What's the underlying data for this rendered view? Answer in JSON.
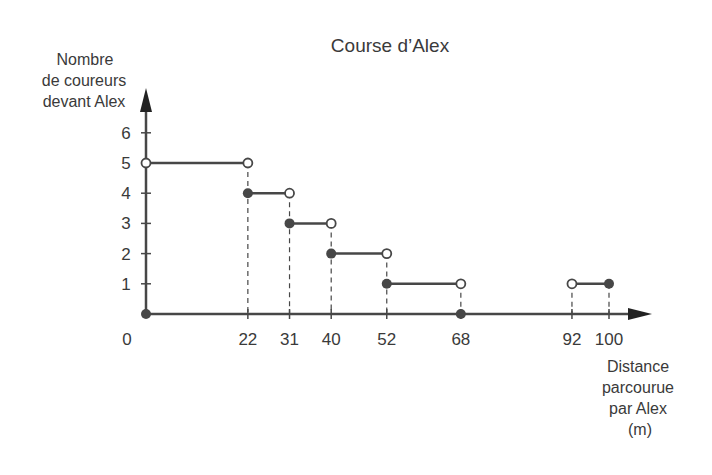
{
  "chart_data": {
    "type": "line",
    "subtype": "step",
    "title": "Course d’Alex",
    "ylabel": [
      "Nombre",
      "de coureurs",
      "devant Alex"
    ],
    "xlabel": [
      "Distance",
      "parcourue",
      "par Alex",
      "(m)"
    ],
    "origin_label": "0",
    "xlim": [
      0,
      100
    ],
    "ylim": [
      0,
      6
    ],
    "x_ticks": [
      22,
      31,
      40,
      52,
      68,
      92,
      100
    ],
    "x_tick_labels": [
      "22",
      "31",
      "40",
      "52",
      "68",
      "92",
      "100"
    ],
    "y_ticks": [
      1,
      2,
      3,
      4,
      5,
      6
    ],
    "y_tick_labels": [
      "1",
      "2",
      "3",
      "4",
      "5",
      "6"
    ],
    "grid": false,
    "segments": [
      {
        "x_start": 0,
        "x_end": 22,
        "y": 5,
        "start_closed": false,
        "end_closed": false
      },
      {
        "x_start": 22,
        "x_end": 31,
        "y": 4,
        "start_closed": true,
        "end_closed": false
      },
      {
        "x_start": 31,
        "x_end": 40,
        "y": 3,
        "start_closed": true,
        "end_closed": false
      },
      {
        "x_start": 40,
        "x_end": 52,
        "y": 2,
        "start_closed": true,
        "end_closed": false
      },
      {
        "x_start": 52,
        "x_end": 68,
        "y": 1,
        "start_closed": true,
        "end_closed": false
      },
      {
        "x_start": 68,
        "x_end": 92,
        "y": 0,
        "start_closed": true,
        "end_closed": false
      },
      {
        "x_start": 92,
        "x_end": 100,
        "y": 1,
        "start_closed": false,
        "end_closed": true
      }
    ],
    "isolated_points": [
      {
        "x": 0,
        "y": 0,
        "closed": true
      }
    ],
    "guide_lines_at_x": [
      22,
      31,
      40,
      52,
      68,
      92,
      100
    ]
  },
  "colors": {
    "line": "#474747",
    "text": "#3a3a3a",
    "open_fill": "#ffffff"
  }
}
